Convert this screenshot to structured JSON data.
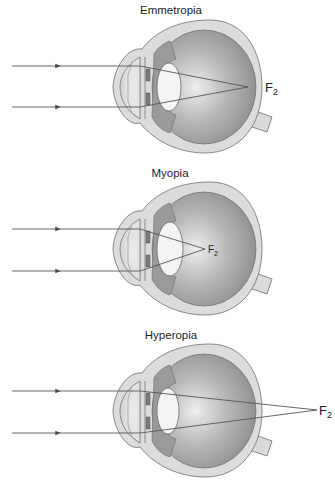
{
  "diagrams": [
    {
      "title": "Emmetropia",
      "focal_label": "F",
      "focal_subscript": "2",
      "focus_location": "on retina"
    },
    {
      "title": "Myopia",
      "focal_label": "F",
      "focal_subscript": "2",
      "focus_location": "in front of retina"
    },
    {
      "title": "Hyperopia",
      "focal_label": "F",
      "focal_subscript": "2",
      "focus_location": "behind retina"
    }
  ],
  "colors": {
    "sclera": "#dcdcdc",
    "vitreous_dark": "#8c8c8c",
    "vitreous_light": "#e8e8e8",
    "lens": "#f4f4f4",
    "ray": "#555555",
    "text": "#222222"
  }
}
